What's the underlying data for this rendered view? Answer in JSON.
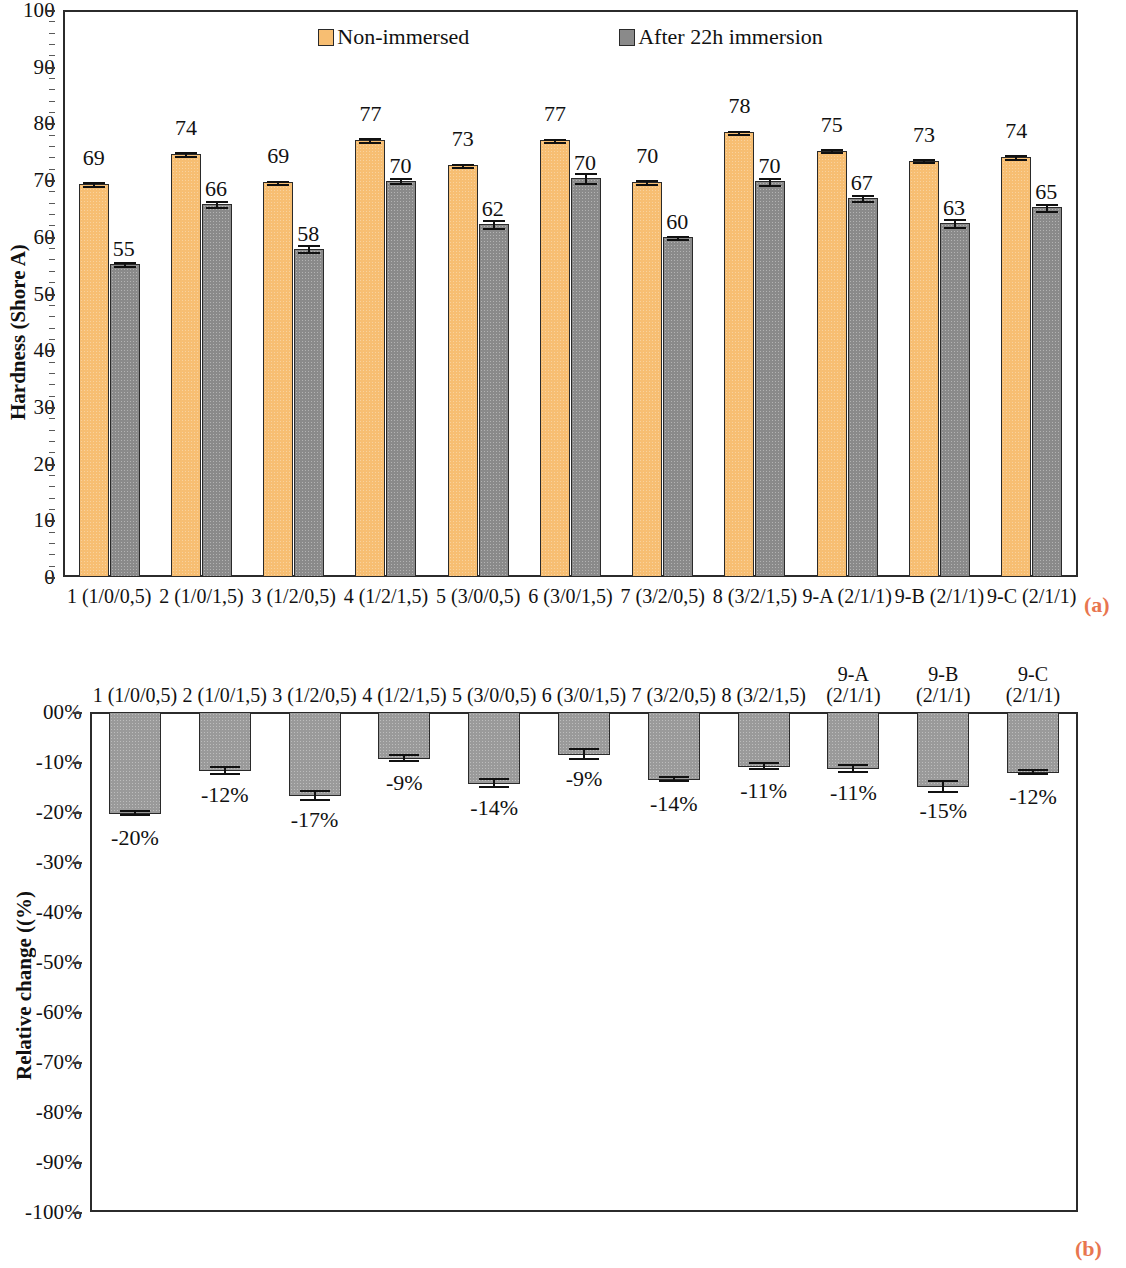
{
  "figure": {
    "title_partial": "",
    "panel_a_tag": "(a)",
    "panel_b_tag": "(b)",
    "accent_tag_color": "#E8764F",
    "series_colors": {
      "non_immersed": "#F7BE72",
      "after_immersion": "#8A8A8A"
    }
  },
  "legend": {
    "items": [
      {
        "label": "Non-immersed",
        "key": "light"
      },
      {
        "label": "After 22h immersion",
        "key": "dark"
      }
    ]
  },
  "chart_data": [
    {
      "panel": "(a)",
      "type": "bar",
      "title": "",
      "xlabel": "",
      "ylabel": "Hardness (Shore A)",
      "ylim": [
        0,
        100
      ],
      "ytick_labels": [
        "100",
        "90",
        "80",
        "70",
        "60",
        "50",
        "40",
        "30",
        "20",
        "10",
        "0"
      ],
      "ytick_values": [
        100,
        90,
        80,
        70,
        60,
        50,
        40,
        30,
        20,
        10,
        0
      ],
      "grid": false,
      "legend_position": "top-center",
      "categories": [
        "1 (1/0/0,5)",
        "2 (1/0/1,5)",
        "3 (1/2/0,5)",
        "4 (1/2/1,5)",
        "5 (3/0/0,5)",
        "6 (3/0/1,5)",
        "7 (3/2/0,5)",
        "8 (3/2/1,5)",
        "9-A (2/1/1)",
        "9-B (2/1/1)",
        "9-C (2/1/1)"
      ],
      "series": [
        {
          "name": "Non-immersed",
          "values": [
            69,
            74,
            69,
            77,
            73,
            77,
            70,
            78,
            75,
            73,
            74
          ],
          "plotted": [
            69.3,
            74.6,
            69.6,
            77.1,
            72.6,
            77.0,
            69.7,
            78.4,
            75.2,
            73.4,
            74.1
          ],
          "errors": [
            0.5,
            0.5,
            0.5,
            0.5,
            0.5,
            0.5,
            0.5,
            0.5,
            0.5,
            0.4,
            0.5
          ]
        },
        {
          "name": "After 22h immersion",
          "values": [
            55,
            66,
            58,
            70,
            62,
            70,
            60,
            70,
            67,
            63,
            65
          ],
          "plotted": [
            55.2,
            65.8,
            57.9,
            69.9,
            62.2,
            70.4,
            59.9,
            69.8,
            66.9,
            62.4,
            65.2
          ],
          "errors": [
            0.6,
            0.7,
            0.8,
            0.6,
            0.9,
            1.1,
            0.5,
            0.8,
            0.7,
            0.9,
            0.8
          ]
        }
      ]
    },
    {
      "panel": "(b)",
      "type": "bar",
      "title": "",
      "xlabel": "",
      "ylabel": "Relative change ((%)",
      "ylim": [
        -100,
        0
      ],
      "ytick_labels": [
        "00%",
        "-10%",
        "-20%",
        "-30%",
        "-40%",
        "-50%",
        "-60%",
        "-70%",
        "-80%",
        "-90%",
        "-100%"
      ],
      "ytick_values": [
        0,
        -10,
        -20,
        -30,
        -40,
        -50,
        -60,
        -70,
        -80,
        -90,
        -100
      ],
      "grid": false,
      "legend_position": "none",
      "categories": [
        "1 (1/0/0,5)",
        "2 (1/0/1,5)",
        "3 (1/2/0,5)",
        "4 (1/2/1,5)",
        "5 (3/0/0,5)",
        "6 (3/0/1,5)",
        "7 (3/2/0,5)",
        "8 (3/2/1,5)",
        "9-A\n(2/1/1)",
        "9-B\n(2/1/1)",
        "9-C\n(2/1/1)"
      ],
      "category_lines": [
        [
          "1 (1/0/0,5)"
        ],
        [
          "2 (1/0/1,5)"
        ],
        [
          "3 (1/2/0,5)"
        ],
        [
          "4 (1/2/1,5)"
        ],
        [
          "5 (3/0/0,5)"
        ],
        [
          "6 (3/0/1,5)"
        ],
        [
          "7 (3/2/0,5)"
        ],
        [
          "8 (3/2/1,5)"
        ],
        [
          "9-A",
          "(2/1/1)"
        ],
        [
          "9-B",
          "(2/1/1)"
        ],
        [
          "9-C",
          "(2/1/1)"
        ]
      ],
      "series": [
        {
          "name": "Relative change",
          "labels": [
            "-20%",
            "-12%",
            "-17%",
            "-9%",
            "-14%",
            "-9%",
            "-14%",
            "-11%",
            "-11%",
            "-15%",
            "-12%"
          ],
          "values": [
            -20,
            -12,
            -17,
            -9,
            -14,
            -9,
            -14,
            -11,
            -11,
            -15,
            -12
          ],
          "plotted": [
            -20.3,
            -11.8,
            -16.8,
            -9.4,
            -14.3,
            -8.6,
            -13.6,
            -10.9,
            -11.4,
            -15.0,
            -12.2
          ],
          "errors": [
            0.6,
            0.9,
            1.1,
            0.8,
            1.0,
            1.2,
            0.5,
            0.8,
            0.9,
            1.3,
            0.5
          ]
        }
      ]
    }
  ]
}
